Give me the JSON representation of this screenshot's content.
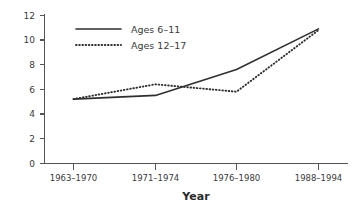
{
  "chart_data": {
    "type": "line",
    "title": "",
    "subtitle": "",
    "xlabel": "Year",
    "ylabel": "",
    "categories": [
      "1963–1970",
      "1971–1974",
      "1976–1980",
      "1988–1994"
    ],
    "series": [
      {
        "name": "Ages 6–11",
        "style": "solid",
        "values": [
          5.2,
          5.5,
          7.6,
          10.9
        ]
      },
      {
        "name": "Ages 12–17",
        "style": "dotted",
        "values": [
          5.2,
          6.4,
          5.8,
          10.8
        ]
      }
    ],
    "ylim": [
      0,
      12
    ],
    "ytick_step": 2,
    "yticks": [
      "0",
      "2",
      "4",
      "6",
      "8",
      "10",
      "12"
    ],
    "grid": false,
    "legend_position": "top-left-inside",
    "colors": {
      "line": "#2f2f2f",
      "axis": "#555555",
      "text": "#3a3a3a",
      "background": "#ffffff"
    }
  },
  "legend": {
    "entries": [
      {
        "label": "Ages 6–11"
      },
      {
        "label": "Ages 12–17"
      }
    ]
  },
  "axis": {
    "x_title": "Year",
    "y_tick_labels": [
      "12",
      "10",
      "8",
      "6",
      "4",
      "2",
      "0"
    ],
    "x_tick_labels": [
      "1963–1970",
      "1971–1974",
      "1976–1980",
      "1988–1994"
    ]
  }
}
